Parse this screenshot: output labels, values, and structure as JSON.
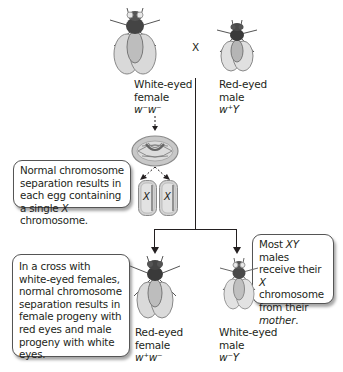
{
  "parents": {
    "cross_symbol": "X",
    "female": {
      "line1": "White-eyed",
      "line2": "female",
      "genotype": "w⁻w⁻"
    },
    "male": {
      "line1": "Red-eyed",
      "line2": "male",
      "genotype": "w⁺Y"
    }
  },
  "meiosis": {
    "egg_labels": [
      "X",
      "X"
    ]
  },
  "callouts": {
    "separation": {
      "parts": [
        "Normal chromosome separation results in each egg containing a single ",
        "X",
        " chromosome."
      ]
    },
    "cross": {
      "text": "In a cross with white-eyed females, normal chromosome separation results in female progeny with red eyes and male progeny with white eyes."
    },
    "males": {
      "parts": [
        "Most ",
        "XY",
        " males receive their ",
        "X",
        " chromosome from their ",
        "mother",
        "."
      ]
    }
  },
  "progeny": {
    "female": {
      "line1": "Red-eyed",
      "line2": "female",
      "genotype": "w⁺w⁻"
    },
    "male": {
      "line1": "White-eyed",
      "line2": "male",
      "genotype": "w⁻Y"
    }
  }
}
